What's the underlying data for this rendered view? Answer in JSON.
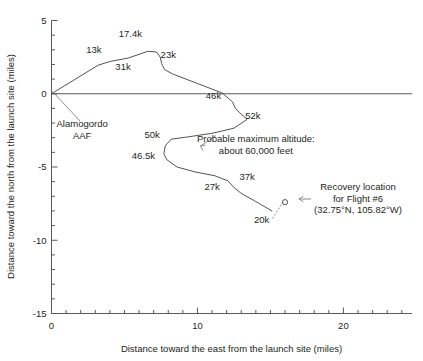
{
  "chart_data": {
    "type": "line",
    "title": "",
    "xlabel": "Distance toward the east from the launch site (miles)",
    "ylabel": "Distance toward the north from the launch site (miles)",
    "xlim": [
      0,
      24.7
    ],
    "ylim": [
      -15,
      5
    ],
    "xticks": [
      0,
      10,
      20
    ],
    "yticks": [
      5,
      0,
      -5,
      -10,
      -15
    ],
    "xtick_labels": [
      "0",
      "10",
      "20"
    ],
    "ytick_labels": [
      "5",
      "0",
      "-5",
      "-10",
      "-15"
    ],
    "minor_tick_interval": 1,
    "grid": false,
    "legend": "none",
    "series": [
      {
        "name": "Flight #6 ground track",
        "points": [
          [
            0.0,
            0.0
          ],
          [
            3.2,
            1.95
          ],
          [
            4.0,
            2.2
          ],
          [
            5.3,
            2.45
          ],
          [
            6.6,
            2.9
          ],
          [
            7.2,
            2.85
          ],
          [
            7.45,
            2.5
          ],
          [
            7.55,
            2.05
          ],
          [
            7.75,
            1.65
          ],
          [
            8.3,
            1.35
          ],
          [
            10.0,
            0.7
          ],
          [
            11.7,
            0.05
          ],
          [
            12.4,
            -0.55
          ],
          [
            12.6,
            -1.0
          ],
          [
            12.9,
            -1.3
          ],
          [
            13.4,
            -1.75
          ],
          [
            12.5,
            -2.35
          ],
          [
            11.0,
            -2.7
          ],
          [
            9.3,
            -2.95
          ],
          [
            8.2,
            -3.1
          ],
          [
            7.8,
            -3.55
          ],
          [
            7.7,
            -4.1
          ],
          [
            7.9,
            -4.5
          ],
          [
            8.6,
            -5.0
          ],
          [
            9.9,
            -5.35
          ],
          [
            11.2,
            -5.6
          ],
          [
            12.1,
            -5.95
          ],
          [
            12.5,
            -6.4
          ],
          [
            13.0,
            -6.8
          ],
          [
            13.9,
            -7.3
          ],
          [
            15.1,
            -8.0
          ]
        ]
      }
    ],
    "point_labels": [
      {
        "text": "13k",
        "x": 2.9,
        "y": 2.75
      },
      {
        "text": "17.4k",
        "x": 5.4,
        "y": 3.85
      },
      {
        "text": "31k",
        "x": 4.9,
        "y": 1.6
      },
      {
        "text": "23k",
        "x": 8.0,
        "y": 2.45
      },
      {
        "text": "46k",
        "x": 11.1,
        "y": -0.35
      },
      {
        "text": "52k",
        "x": 13.8,
        "y": -1.7
      },
      {
        "text": "50k",
        "x": 6.9,
        "y": -3.0
      },
      {
        "text": "46.5k",
        "x": 6.3,
        "y": -4.45
      },
      {
        "text": "27k",
        "x": 11.0,
        "y": -6.6
      },
      {
        "text": "37k",
        "x": 13.4,
        "y": -5.9
      },
      {
        "text": "20k",
        "x": 14.4,
        "y": -8.8
      }
    ],
    "annotations": [
      {
        "name": "launch-site",
        "lines": [
          "Alamogordo",
          "AAF"
        ],
        "x": 2.1,
        "y": -2.3
      },
      {
        "name": "max-altitude",
        "lines": [
          "Probable maximum altitude:",
          "about 60,000 feet"
        ],
        "x": 14.0,
        "y": -3.3
      },
      {
        "name": "recovery-location",
        "lines": [
          "Recovery location",
          "for Flight #6",
          "(32.75°N, 105.82°W)"
        ],
        "x": 21.0,
        "y": -6.6
      }
    ],
    "markers": [
      {
        "name": "recovery-point",
        "shape": "open-circle",
        "x": 16.0,
        "y": -7.4
      }
    ],
    "colors": {
      "track": "#404041",
      "axis": "#58595b",
      "text": "#231f20",
      "leader": "#6d6e71",
      "background": "#ffffff"
    }
  }
}
